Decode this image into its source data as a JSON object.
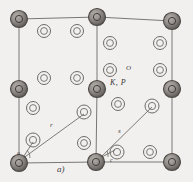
{
  "figure": {
    "caption_label": "a)",
    "kind": "crystal-structure-unit-cell-diagram",
    "background_color": "#f2f0ee",
    "line_color": "#6b6866",
    "atom_dark_color": "#8a8683",
    "atom_dark_ring_color": "#4c4845",
    "atom_light_ring_color": "#6e6a67"
  },
  "labels": {
    "oxygen": "O",
    "potassium_phosphorus": "K, P",
    "axis_a": "a)",
    "radius_1": "r",
    "radius_2": "s",
    "angle_alpha": "a",
    "angle_gamma": "c"
  },
  "cell": {
    "corners": [
      {
        "name": "top-left",
        "x": 19,
        "y": 19
      },
      {
        "name": "top-center",
        "x": 97,
        "y": 17
      },
      {
        "name": "top-right",
        "x": 172,
        "y": 21
      },
      {
        "name": "mid-left",
        "x": 19,
        "y": 89
      },
      {
        "name": "mid-center",
        "x": 97,
        "y": 89
      },
      {
        "name": "mid-right",
        "x": 172,
        "y": 89
      },
      {
        "name": "bottom-left",
        "x": 19,
        "y": 163
      },
      {
        "name": "bottom-center",
        "x": 96,
        "y": 162
      },
      {
        "name": "bottom-right",
        "x": 172,
        "y": 162
      }
    ]
  },
  "atoms_dark": [
    {
      "label": "K, P",
      "x": 19,
      "y": 19,
      "r": 8.5
    },
    {
      "label": "K, P",
      "x": 97,
      "y": 17,
      "r": 8.5
    },
    {
      "label": "K, P",
      "x": 172,
      "y": 21,
      "r": 8.5
    },
    {
      "label": "K, P",
      "x": 19,
      "y": 89,
      "r": 8.5
    },
    {
      "label": "K, P",
      "x": 97,
      "y": 89,
      "r": 8.5
    },
    {
      "label": "K, P",
      "x": 172,
      "y": 89,
      "r": 8.5
    },
    {
      "label": "K, P",
      "x": 19,
      "y": 163,
      "r": 8.5
    },
    {
      "label": "K, P",
      "x": 96,
      "y": 162,
      "r": 8.5
    },
    {
      "label": "K, P",
      "x": 172,
      "y": 162,
      "r": 8.5
    }
  ],
  "atoms_light": [
    {
      "label": "O",
      "x": 44,
      "y": 31,
      "r": 6.5
    },
    {
      "label": "O",
      "x": 77,
      "y": 31,
      "r": 6.5
    },
    {
      "label": "O",
      "x": 110,
      "y": 43,
      "r": 6.5
    },
    {
      "label": "O",
      "x": 160,
      "y": 43,
      "r": 6.5
    },
    {
      "label": "O",
      "x": 44,
      "y": 78,
      "r": 6.5
    },
    {
      "label": "O",
      "x": 77,
      "y": 78,
      "r": 6.5
    },
    {
      "label": "O",
      "x": 110,
      "y": 70,
      "r": 6.5
    },
    {
      "label": "O",
      "x": 160,
      "y": 70,
      "r": 6.5
    },
    {
      "label": "O",
      "x": 33,
      "y": 108,
      "r": 6.5
    },
    {
      "label": "O",
      "x": 84,
      "y": 112,
      "r": 7.0
    },
    {
      "label": "O",
      "x": 118,
      "y": 104,
      "r": 6.5
    },
    {
      "label": "O",
      "x": 152,
      "y": 106,
      "r": 7.0
    },
    {
      "label": "O",
      "x": 33,
      "y": 140,
      "r": 7.0
    },
    {
      "label": "O",
      "x": 84,
      "y": 143,
      "r": 6.5
    },
    {
      "label": "O",
      "x": 117,
      "y": 152,
      "r": 7.0
    },
    {
      "label": "O",
      "x": 150,
      "y": 152,
      "r": 6.5
    }
  ],
  "bonds": [
    {
      "name": "bond-r",
      "x1": 22,
      "y1": 159,
      "x2": 84,
      "y2": 114
    },
    {
      "name": "bond-s",
      "x1": 100,
      "y1": 158,
      "x2": 152,
      "y2": 107
    },
    {
      "name": "bond-alpha-tick",
      "x1": 22,
      "y1": 159,
      "x2": 33,
      "y2": 142
    },
    {
      "name": "bond-gamma-tick",
      "x1": 100,
      "y1": 158,
      "x2": 115,
      "y2": 150
    }
  ]
}
